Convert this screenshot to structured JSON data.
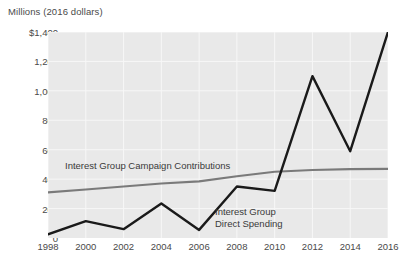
{
  "chart_data": {
    "type": "line",
    "title": "Millions (2016 dollars)",
    "xlabel": "",
    "ylabel": "Millions (2016 dollars)",
    "x": [
      1998,
      2000,
      2002,
      2004,
      2006,
      2008,
      2010,
      2012,
      2014,
      2016
    ],
    "xtick_labels": [
      "1998",
      "2000",
      "2002",
      "2004",
      "2006",
      "2008",
      "2010",
      "2012",
      "2014",
      "2016"
    ],
    "ytick_labels": [
      "$1,400",
      "1,200",
      "1,000",
      "800",
      "600",
      "400",
      "200",
      "0"
    ],
    "ytick_values": [
      1400,
      1200,
      1000,
      800,
      600,
      400,
      200,
      0
    ],
    "ylim": [
      0,
      1400
    ],
    "xlim": [
      1998,
      2016
    ],
    "grid": true,
    "legend": "inline-annotations",
    "series": [
      {
        "name": "Interest Group Campaign Contributions",
        "color": "#7a7a7a",
        "values": [
          310,
          330,
          350,
          370,
          385,
          420,
          450,
          462,
          468,
          470
        ]
      },
      {
        "name": "Interest Group Direct Spending",
        "color": "#1a1a1a",
        "values": [
          25,
          115,
          60,
          235,
          55,
          350,
          320,
          1100,
          590,
          1400
        ]
      }
    ],
    "annotations": [
      {
        "text": "Interest Group Campaign Contributions",
        "x": 1998.8,
        "y": 560
      },
      {
        "text": "Interest Group",
        "x": 2006.9,
        "y": 250
      },
      {
        "text": "Direct Spending",
        "x": 2006.9,
        "y": 190
      }
    ]
  },
  "colors": {
    "plot_background": "#e9e9e9",
    "page_background": "#ffffff",
    "gridline": "#f7f7f7",
    "axis_text": "#4a4a4a",
    "contributions_line": "#7a7a7a",
    "direct_spending_line": "#1a1a1a"
  },
  "labels": {
    "series_contributions": "Interest Group Campaign Contributions",
    "series_direct_line1": "Interest Group",
    "series_direct_line2": "Direct Spending"
  }
}
